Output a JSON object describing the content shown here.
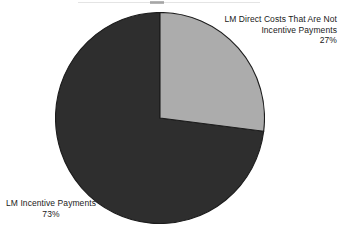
{
  "chart_data": {
    "type": "pie",
    "title": "",
    "subtitle": "",
    "xlabel": "",
    "ylabel": "",
    "grid": false,
    "legend_position": "none",
    "start_angle_deg": 0,
    "direction": "clockwise",
    "categories": [
      "LM Direct Costs That Are Not Incentive Payments",
      "LM Incentive Payments"
    ],
    "values": [
      27,
      73
    ],
    "value_unit": "percent",
    "slices": [
      {
        "name": "LM Direct Costs That Are Not Incentive Payments",
        "value": 27,
        "value_label": "27%",
        "color": "#acacac",
        "start_angle_deg": 0,
        "end_angle_deg": 97.2,
        "label_lines": [
          "LM Direct Costs That Are Not",
          "Incentive Payments",
          "27%"
        ],
        "label_position": "outside-right"
      },
      {
        "name": "LM Incentive Payments",
        "value": 73,
        "value_label": "73%",
        "color": "#2e2e2e",
        "start_angle_deg": 97.2,
        "end_angle_deg": 360,
        "label_lines": [
          "LM Incentive Payments",
          "73%"
        ],
        "label_position": "outside-bottom-left"
      }
    ]
  },
  "labels": {
    "light_slice": {
      "line1": "LM Direct Costs That Are Not",
      "line2": "Incentive Payments",
      "line3": "27%"
    },
    "dark_slice": {
      "line1": "LM Incentive Payments",
      "line2": "73%"
    }
  },
  "colors": {
    "background": "#ffffff",
    "slice_light": "#acacac",
    "slice_dark": "#2e2e2e",
    "outline": "#1c1c1c",
    "text": "#1a1a1a"
  }
}
